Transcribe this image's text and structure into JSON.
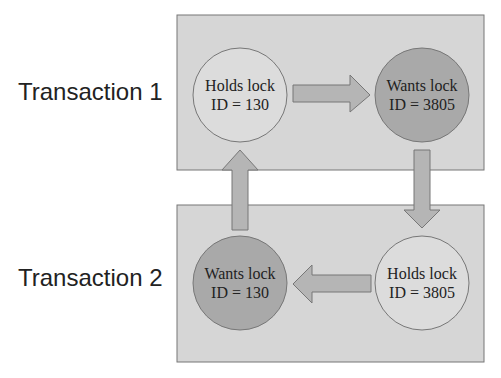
{
  "diagram": {
    "transactions": [
      {
        "label": "Transaction 1",
        "left_node": {
          "line1": "Holds lock",
          "line2": "ID = 130",
          "state": "holds"
        },
        "right_node": {
          "line1": "Wants lock",
          "line2": "ID = 3805",
          "state": "wants"
        }
      },
      {
        "label": "Transaction 2",
        "left_node": {
          "line1": "Wants lock",
          "line2": "ID = 130",
          "state": "wants"
        },
        "right_node": {
          "line1": "Holds lock",
          "line2": "ID = 3805",
          "state": "holds"
        }
      }
    ],
    "colors": {
      "box": "#d6d6d6",
      "holds": "#dcdcdc",
      "wants": "#a9a9a9",
      "arrow": "#b5b5b5",
      "stroke": "#777777"
    }
  }
}
